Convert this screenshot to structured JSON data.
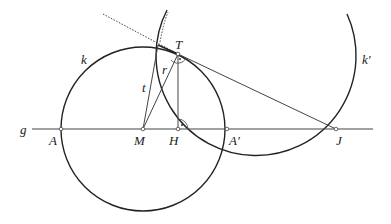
{
  "diagram": {
    "colors": {
      "stroke": "#222222",
      "thin": "#444444",
      "point_fill": "#ffffff"
    },
    "line_g": {
      "label": "g",
      "x1": 32,
      "x2": 373,
      "y": 129
    },
    "points": {
      "A": {
        "label": "A",
        "x": 61,
        "y": 129
      },
      "M": {
        "label": "M",
        "x": 143,
        "y": 129
      },
      "H": {
        "label": "H",
        "x": 178,
        "y": 129
      },
      "A_prime": {
        "label": "A′",
        "x": 227,
        "y": 129
      },
      "J": {
        "label": "J",
        "x": 336,
        "y": 129
      },
      "T": {
        "label": "T",
        "x": 178,
        "y": 54
      },
      "P": {
        "x": 158,
        "y": 45
      }
    },
    "circle_k": {
      "label": "k",
      "cx": 143,
      "cy": 129,
      "r": 82
    },
    "circle_k_prime": {
      "label": "k′",
      "cx": 257,
      "cy": 67,
      "r": 100
    },
    "segments": {
      "t": {
        "label": "t"
      },
      "r": {
        "label": "r"
      }
    }
  }
}
